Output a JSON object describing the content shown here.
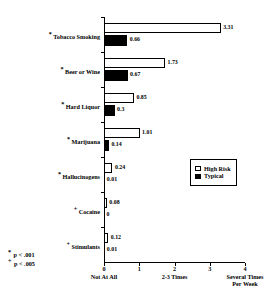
{
  "chart_data": {
    "type": "bar",
    "orientation": "horizontal",
    "title": "",
    "xlabel": "",
    "ylabel": "",
    "xlim": [
      0,
      4
    ],
    "grid": false,
    "legend_position": "middle-right",
    "categories": [
      "Tobacco Smoking",
      "Beer or Wine",
      "Hard Liquor",
      "Marijuana",
      "Hallucinogens",
      "Cocaine",
      "Stimulants"
    ],
    "category_significance": [
      "*",
      "*",
      "*",
      "*",
      "*",
      "+",
      "+"
    ],
    "series": [
      {
        "name": "High Risk",
        "color": "#ffffff",
        "values": [
          3.31,
          1.73,
          0.85,
          1.01,
          0.24,
          0.08,
          0.12
        ]
      },
      {
        "name": "Typical",
        "color": "#000000",
        "values": [
          0.66,
          0.67,
          0.3,
          0.14,
          0.01,
          0.0,
          0.01
        ]
      }
    ],
    "value_labels": {
      "high_risk": [
        "3.31",
        "1.73",
        "0.85",
        "1.01",
        "0.24",
        "0.08",
        "0.12"
      ],
      "typical": [
        "0.66",
        "0.67",
        "0.3",
        "0.14",
        "0.01",
        "0",
        "0.01"
      ]
    },
    "xticks": [
      {
        "value": 0,
        "number": "0",
        "caption": "Not At All"
      },
      {
        "value": 1,
        "number": "1",
        "caption": ""
      },
      {
        "value": 2,
        "number": "2",
        "caption": "2-3 Times"
      },
      {
        "value": 3,
        "number": "3",
        "caption": ""
      },
      {
        "value": 4,
        "number": "4",
        "caption": "Several Times\nPer Week"
      }
    ]
  },
  "legend": {
    "items": [
      {
        "label": "High Risk",
        "swatch": "open-square"
      },
      {
        "label": "Typical",
        "swatch": "filled-square"
      }
    ]
  },
  "footnotes": [
    {
      "marker": "*",
      "text": "p < .001"
    },
    {
      "marker": "+",
      "text": "p < .005"
    }
  ]
}
